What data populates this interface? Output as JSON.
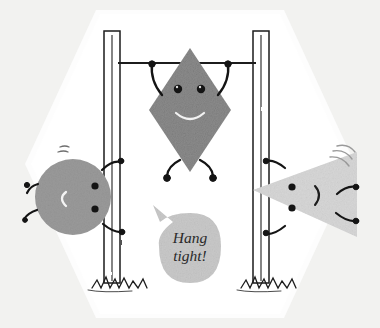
{
  "scene": {
    "title": "Hang tight cartoon shapes on a pull-up bar",
    "width": 380,
    "height": 328,
    "background_color": "#f2f2f0",
    "card_color": "#ffffff",
    "ink_color": "#1a1a1a"
  },
  "speech_bubble": {
    "line1": "Hang",
    "line2": "tight!",
    "full_text": "Hang tight!",
    "fill_color": "#c9c9c9",
    "text_color": "#2a2a2a"
  },
  "characters": [
    {
      "name": "circle-character",
      "shape": "circle",
      "fill_color": "#9a9a9a",
      "mouth": "C",
      "eyes": 2,
      "position": "left"
    },
    {
      "name": "diamond-character",
      "shape": "diamond",
      "fill_color": "#8c8c8c",
      "mouth": "smile",
      "eyes": 2,
      "position": "center-hanging"
    },
    {
      "name": "triangle-character",
      "shape": "triangle",
      "fill_color": "#d7d7d7",
      "mouth": ")",
      "eyes": 2,
      "position": "right"
    }
  ],
  "equipment": {
    "left_pole_label": "left pole",
    "right_pole_label": "right pole",
    "crossbar_label": "horizontal bar",
    "ground_label": "grass tufts"
  }
}
